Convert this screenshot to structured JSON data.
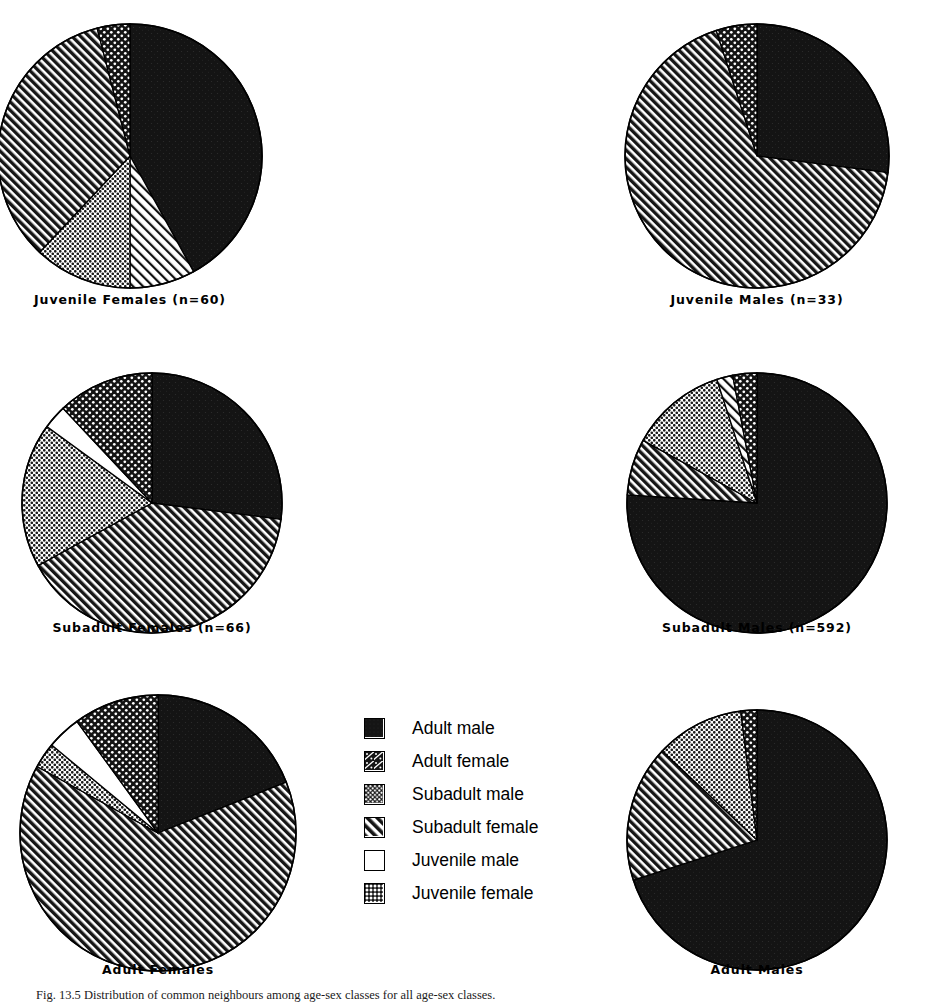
{
  "figure": {
    "caption": "Fig. 13.5  Distribution of common neighbours among age-sex classes for all age-sex classes.",
    "background": "#ffffff",
    "ink": "#000000"
  },
  "legend": {
    "name": "age-sex-class-legend",
    "items": [
      {
        "label": "Adult male",
        "pattern": "solid-black",
        "swatch": "adult-male-swatch"
      },
      {
        "label": "Adult female",
        "pattern": "sparse-dot-hatch",
        "swatch": "adult-female-swatch"
      },
      {
        "label": "Subadult male",
        "pattern": "dotted-grey",
        "swatch": "subadult-male-swatch"
      },
      {
        "label": "Subadult female",
        "pattern": "diagonal-hatch",
        "swatch": "subadult-female-swatch"
      },
      {
        "label": "Juvenile male",
        "pattern": "white",
        "swatch": "juvenile-male-swatch"
      },
      {
        "label": "Juvenile female",
        "pattern": "coarse-dots",
        "swatch": "juvenile-female-swatch"
      }
    ]
  },
  "chart_data": [
    {
      "type": "pie",
      "id": "juvenile-females",
      "title": "Juvenile  Females  (n=60)",
      "n": 60,
      "categories": [
        "Adult male",
        "Adult female",
        "Subadult male",
        "Subadult female",
        "Juvenile male",
        "Juvenile female"
      ],
      "values": [
        42,
        8,
        12,
        34,
        0,
        4
      ],
      "patterns": [
        "solid-black",
        "diagonal-hatch-light",
        "dotted-grey",
        "diagonal-hatch",
        "white",
        "coarse-dots"
      ],
      "start_angle": 0
    },
    {
      "type": "pie",
      "id": "juvenile-males",
      "title": "Juvenile  Males  (n=33)",
      "n": 33,
      "categories": [
        "Adult male",
        "Subadult female",
        "Juvenile female"
      ],
      "values": [
        27,
        68,
        5
      ],
      "patterns": [
        "solid-black",
        "diagonal-hatch",
        "coarse-dots"
      ],
      "start_angle": 0
    },
    {
      "type": "pie",
      "id": "subadult-females",
      "title": "Subadult  Females  (n=66)",
      "n": 66,
      "categories": [
        "Adult male",
        "Subadult female",
        "Subadult male",
        "Juvenile male",
        "Juvenile female"
      ],
      "values": [
        27,
        40,
        18,
        3,
        12
      ],
      "patterns": [
        "solid-black",
        "diagonal-hatch",
        "dotted-grey",
        "white",
        "coarse-dots"
      ],
      "start_angle": 0
    },
    {
      "type": "pie",
      "id": "subadult-males",
      "title": "Subadult  Males  (n=592)",
      "n": 592,
      "categories": [
        "Adult male",
        "Subadult female",
        "Subadult male",
        "Adult female",
        "Juvenile female"
      ],
      "values": [
        76,
        7,
        12,
        2,
        3
      ],
      "patterns": [
        "solid-black",
        "diagonal-hatch",
        "dotted-grey",
        "diagonal-hatch-light",
        "coarse-dots"
      ],
      "start_angle": 0
    },
    {
      "type": "pie",
      "id": "adult-females",
      "title": "Adult  Females",
      "n": null,
      "categories": [
        "Adult male",
        "Subadult female",
        "Subadult male",
        "Juvenile male",
        "Juvenile female"
      ],
      "values": [
        19,
        64,
        3,
        4,
        10
      ],
      "patterns": [
        "solid-black",
        "diagonal-hatch",
        "dotted-grey",
        "white",
        "coarse-dots"
      ],
      "start_angle": 0
    },
    {
      "type": "pie",
      "id": "adult-males",
      "title": "Adult  Males",
      "n": null,
      "categories": [
        "Adult male",
        "Subadult female",
        "Subadult male",
        "Juvenile female"
      ],
      "values": [
        70,
        17,
        11,
        2
      ],
      "patterns": [
        "solid-black",
        "diagonal-hatch",
        "dotted-grey",
        "coarse-dots"
      ],
      "start_angle": 0
    }
  ],
  "layout": {
    "pies": [
      {
        "id": "juvenile-females",
        "cx": 130,
        "cy": 156,
        "r": 132,
        "label_y": 292
      },
      {
        "id": "juvenile-males",
        "cx": 757,
        "cy": 156,
        "r": 132,
        "label_y": 292
      },
      {
        "id": "subadult-females",
        "cx": 152,
        "cy": 503,
        "r": 130,
        "label_y": 620
      },
      {
        "id": "subadult-males",
        "cx": 757,
        "cy": 503,
        "r": 130,
        "label_y": 620
      },
      {
        "id": "adult-females",
        "cx": 158,
        "cy": 833,
        "r": 138,
        "label_y": 962
      },
      {
        "id": "adult-males",
        "cx": 757,
        "cy": 840,
        "r": 130,
        "label_y": 962
      }
    ]
  }
}
